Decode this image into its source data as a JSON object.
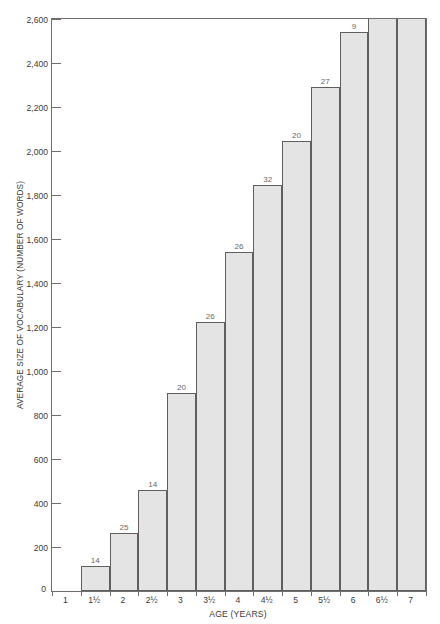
{
  "chart_data": {
    "type": "bar",
    "title": "",
    "xlabel": "AGE  (YEARS)",
    "ylabel": "AVERAGE SIZE OF VOCABULARY (NUMBER OF WORDS)",
    "categories": [
      "1",
      "1½",
      "2",
      "2½",
      "3",
      "3½",
      "4",
      "4½",
      "5",
      "5½",
      "6",
      "6½",
      "7"
    ],
    "values": [
      0,
      115,
      265,
      460,
      900,
      1225,
      1540,
      1845,
      2045,
      2290,
      2540,
      2600,
      2600
    ],
    "point_labels": [
      "",
      "14",
      "25",
      "14",
      "20",
      "26",
      "26",
      "32",
      "20",
      "27",
      "9",
      "",
      ""
    ],
    "ylim": [
      0,
      2600
    ],
    "xlim_note": "13 equal category slots",
    "yticks": [
      0,
      200,
      400,
      600,
      800,
      1000,
      1200,
      1400,
      1600,
      1800,
      2000,
      2200,
      2400,
      2600
    ],
    "ytick_labels": [
      "0",
      "200",
      "400",
      "600",
      "800",
      "1,000",
      "1,200",
      "1,400",
      "1,600",
      "1,800",
      "2,000",
      "2,200",
      "2,400",
      "2,600"
    ],
    "grid": false,
    "legend": false,
    "bar_fill": "#e4e4e4",
    "bar_edge": "#5f5f5f",
    "axis_color": "#6e6e6e",
    "text_color": "#3a3a3a",
    "value_label_color": "#6a6a6a",
    "background": "#ffffff"
  }
}
